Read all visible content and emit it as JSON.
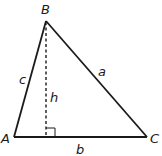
{
  "diagram": {
    "vertices": {
      "A": {
        "label": "A",
        "x": 14,
        "y": 137
      },
      "B": {
        "label": "B",
        "x": 46,
        "y": 21
      },
      "C": {
        "label": "C",
        "x": 147,
        "y": 137
      }
    },
    "sides": {
      "a": {
        "label": "a"
      },
      "b": {
        "label": "b"
      },
      "c": {
        "label": "c"
      }
    },
    "altitude": {
      "label": "h",
      "style": "dashed",
      "foot_marker": "right-angle"
    },
    "colors": {
      "stroke": "#1a1a1a",
      "background": "#ffffff"
    }
  }
}
